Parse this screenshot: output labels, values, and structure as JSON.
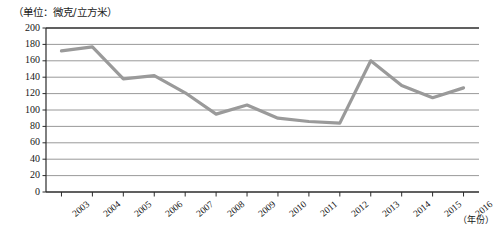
{
  "chart_data": {
    "type": "line",
    "title": "",
    "subtitle": "",
    "unit_note": "（单位：微克/立方米）",
    "xlabel": "（年份）",
    "ylabel": "",
    "categories": [
      "2003",
      "2004",
      "2005",
      "2006",
      "2007",
      "2008",
      "2009",
      "2010",
      "2011",
      "2012",
      "2013",
      "2014",
      "2015",
      "2016"
    ],
    "values": [
      172,
      177,
      138,
      142,
      121,
      95,
      106,
      90,
      86,
      84,
      160,
      130,
      115,
      127
    ],
    "series": [
      {
        "name": "年均浓度",
        "values": [
          172,
          177,
          138,
          142,
          121,
          95,
          106,
          90,
          86,
          84,
          160,
          130,
          115,
          127
        ]
      }
    ],
    "ylim": [
      0,
      200
    ],
    "ytick_step": 20,
    "yticks": [
      0,
      20,
      40,
      60,
      80,
      100,
      120,
      140,
      160,
      180,
      200
    ],
    "ytick_labels": [
      "0",
      "20",
      "40",
      "60",
      "80",
      "100",
      "120",
      "140",
      "160",
      "180",
      "200"
    ],
    "xticks": [
      "2003",
      "2004",
      "2005",
      "2006",
      "2007",
      "2008",
      "2009",
      "2010",
      "2011",
      "2012",
      "2013",
      "2014",
      "2015",
      "2016"
    ],
    "grid": true,
    "grid_axis": "y",
    "legend": false,
    "legend_position": "none",
    "line_color": "#9a9a9a",
    "axis_color": "#2b2b2b",
    "grid_color": "#8d8d8d",
    "background_color": "#ffffff",
    "line_width": 3.2,
    "markers": false,
    "annotations": []
  },
  "axis": {
    "unit_note": "（单位：微克/立方米）",
    "x_unit": "（年份）"
  }
}
